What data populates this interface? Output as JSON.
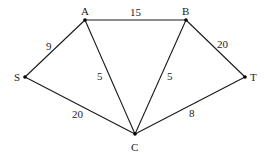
{
  "graph": {
    "nodes": [
      {
        "id": "S",
        "label": "S"
      },
      {
        "id": "A",
        "label": "A"
      },
      {
        "id": "B",
        "label": "B"
      },
      {
        "id": "T",
        "label": "T"
      },
      {
        "id": "C",
        "label": "C"
      }
    ],
    "edges": [
      {
        "from": "S",
        "to": "A",
        "weight": "9"
      },
      {
        "from": "A",
        "to": "B",
        "weight": "15"
      },
      {
        "from": "B",
        "to": "T",
        "weight": "20"
      },
      {
        "from": "A",
        "to": "C",
        "weight": "5"
      },
      {
        "from": "B",
        "to": "C",
        "weight": "5"
      },
      {
        "from": "S",
        "to": "C",
        "weight": "20"
      },
      {
        "from": "C",
        "to": "T",
        "weight": "8"
      }
    ]
  }
}
